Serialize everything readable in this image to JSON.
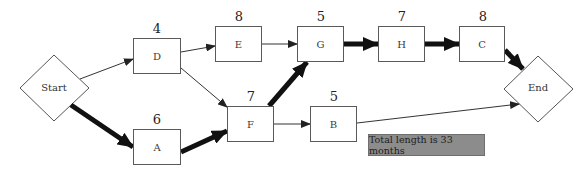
{
  "diagram": {
    "type": "critical-path-network",
    "start": {
      "label": "Start"
    },
    "end": {
      "label": "End"
    },
    "activities": [
      {
        "id": "D",
        "label": "D",
        "duration": "4"
      },
      {
        "id": "E",
        "label": "E",
        "duration": "8"
      },
      {
        "id": "G",
        "label": "G",
        "duration": "5"
      },
      {
        "id": "H",
        "label": "H",
        "duration": "7"
      },
      {
        "id": "C",
        "label": "C",
        "duration": "8"
      },
      {
        "id": "A",
        "label": "A",
        "duration": "6"
      },
      {
        "id": "F",
        "label": "F",
        "duration": "7"
      },
      {
        "id": "B",
        "label": "B",
        "duration": "5"
      }
    ],
    "edges": [
      {
        "from": "Start",
        "to": "D",
        "critical": false
      },
      {
        "from": "Start",
        "to": "A",
        "critical": true
      },
      {
        "from": "D",
        "to": "E",
        "critical": false
      },
      {
        "from": "D",
        "to": "F",
        "critical": false
      },
      {
        "from": "A",
        "to": "F",
        "critical": true
      },
      {
        "from": "E",
        "to": "G",
        "critical": false
      },
      {
        "from": "F",
        "to": "G",
        "critical": true
      },
      {
        "from": "F",
        "to": "B",
        "critical": false
      },
      {
        "from": "G",
        "to": "H",
        "critical": true
      },
      {
        "from": "H",
        "to": "C",
        "critical": true
      },
      {
        "from": "C",
        "to": "End",
        "critical": true
      },
      {
        "from": "B",
        "to": "End",
        "critical": false
      }
    ],
    "total_label": "Total length is 33 months",
    "colors": {
      "critical": "#111111",
      "normal": "#333333",
      "total_fill": "#8c8c8c"
    }
  }
}
